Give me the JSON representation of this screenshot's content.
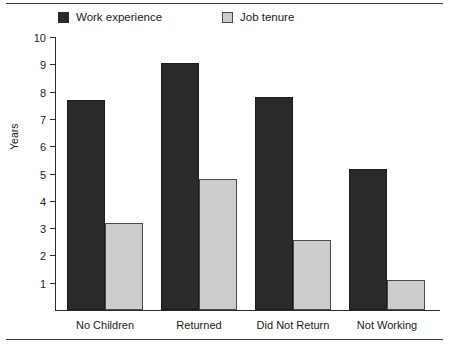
{
  "chart_data": {
    "type": "bar",
    "title": "",
    "xlabel": "",
    "ylabel": "Years",
    "ylim": [
      0,
      10
    ],
    "yticks": [
      1,
      2,
      3,
      4,
      5,
      6,
      7,
      8,
      9,
      10
    ],
    "grid": false,
    "legend_position": "top",
    "categories": [
      "No Children",
      "Returned",
      "Did Not Return",
      "Not Working"
    ],
    "series": [
      {
        "name": "Work experience",
        "color": "#2a2a2a",
        "values": [
          7.7,
          9.05,
          7.8,
          5.15
        ]
      },
      {
        "name": "Job tenure",
        "color": "#cdcdcd",
        "values": [
          3.2,
          4.8,
          2.55,
          1.1
        ]
      }
    ]
  },
  "legend": {
    "items": [
      {
        "label": "Work experience",
        "swatch": "dark-square-icon"
      },
      {
        "label": "Job tenure",
        "swatch": "light-square-icon"
      }
    ]
  },
  "axes": {
    "y_title": "Years",
    "y_tick_labels": [
      "10",
      "9",
      "8",
      "7",
      "6",
      "5",
      "4",
      "3",
      "2",
      "1"
    ],
    "x_tick_labels": [
      "No Children",
      "Returned",
      "Did Not Return",
      "Not Working"
    ]
  },
  "colors": {
    "series_dark": "#2a2a2a",
    "series_light": "#cdcdcd",
    "axis": "#2a2a2a",
    "rule": "#3a3a3a",
    "background": "#ffffff"
  }
}
